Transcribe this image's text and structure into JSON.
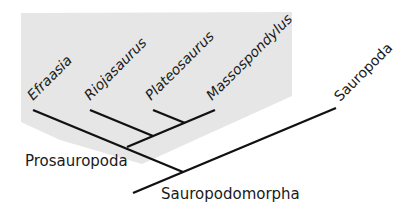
{
  "diagram": {
    "type": "cladogram",
    "colors": {
      "shading": "#e6e6e6",
      "lines": "#111111",
      "text": "#1a1a1a",
      "background": "#ffffff"
    },
    "taxa": [
      {
        "label": "Efraasia"
      },
      {
        "label": "Riojasaurus"
      },
      {
        "label": "Plateosaurus"
      },
      {
        "label": "Massospondylus"
      },
      {
        "label": "Sauropoda"
      }
    ],
    "clades": {
      "prosauropoda": "Prosauropoda",
      "sauropodomorpha": "Sauropodomorpha"
    },
    "shaded_group": "Prosauropoda"
  }
}
